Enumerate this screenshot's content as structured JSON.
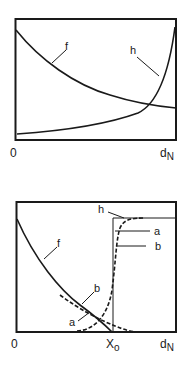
{
  "panels": [
    {
      "id": "top",
      "x_axis": {
        "origin_label": "0",
        "end_label": "d",
        "end_subscript": "N"
      },
      "curves": [
        {
          "name": "f",
          "label": "f",
          "style": "solid",
          "description": "decreasing curve from top-left toward right"
        },
        {
          "name": "h",
          "label": "h",
          "style": "solid",
          "description": "increasing curve rising steeply near right edge"
        }
      ]
    },
    {
      "id": "bottom",
      "x_axis": {
        "origin_label": "0",
        "mid_label": "X",
        "mid_subscript": "o",
        "end_label": "d",
        "end_subscript": "N"
      },
      "curves": [
        {
          "name": "f",
          "label": "f",
          "style": "solid"
        },
        {
          "name": "h",
          "label": "h",
          "style": "solid-step"
        },
        {
          "name": "a-rising",
          "label": "a",
          "style": "dashed"
        },
        {
          "name": "b-rising",
          "label": "b",
          "style": "dashed"
        },
        {
          "name": "a-falling",
          "label": "a",
          "style": "dashed"
        },
        {
          "name": "b-falling",
          "label": "b",
          "style": "dashed"
        }
      ]
    }
  ],
  "colors": {
    "ink": "#1a1a1a",
    "background": "#ffffff"
  }
}
